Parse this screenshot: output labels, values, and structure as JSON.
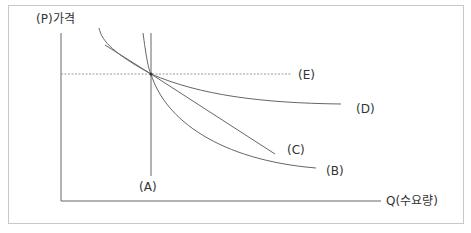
{
  "diagram": {
    "y_axis_label": "(P)가격",
    "x_axis_label": "Q(수요량)",
    "curves": [
      {
        "id": "A",
        "label": "(A)",
        "description": "perfectly inelastic vertical demand"
      },
      {
        "id": "B",
        "label": "(B)",
        "description": "convex demand curve"
      },
      {
        "id": "C",
        "label": "(C)",
        "description": "linear demand curve"
      },
      {
        "id": "D",
        "label": "(D)",
        "description": "flatter demand curve"
      },
      {
        "id": "E",
        "label": "(E)",
        "description": "perfectly elastic horizontal demand (dashed)"
      }
    ],
    "colors": {
      "line": "#555555",
      "dashed": "#9a9a9a",
      "frame": "#c8c8c8",
      "text": "#333333"
    }
  }
}
